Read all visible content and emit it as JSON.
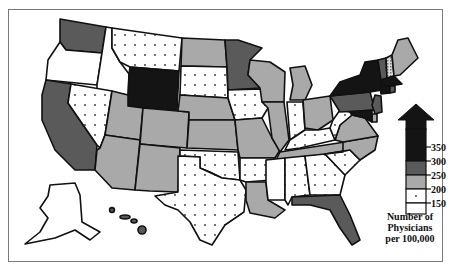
{
  "map": {
    "title": "Number of Physicians per 100,000",
    "legend": {
      "title_lines": [
        "Number of",
        "Physicians",
        "per 100,000"
      ],
      "ticks": [
        "350",
        "300",
        "250",
        "200",
        "150"
      ],
      "classes": [
        {
          "key": "over300",
          "label": "> 300",
          "fill": "#141414",
          "pattern": "solid"
        },
        {
          "key": "250_300",
          "label": "250–300",
          "fill": "#5a5a5a",
          "pattern": "solid"
        },
        {
          "key": "200_250",
          "label": "200–250",
          "fill": "#a9a9a9",
          "pattern": "solid"
        },
        {
          "key": "150_200",
          "label": "150–200",
          "fill": "#ffffff",
          "pattern": "dots"
        },
        {
          "key": "under150",
          "label": "< 150",
          "fill": "#ffffff",
          "pattern": "none"
        }
      ]
    },
    "states": {
      "WA": "250_300",
      "OR": "under150",
      "CA": "250_300",
      "ID": "under150",
      "NV": "150_200",
      "MT": "150_200",
      "WY": "over300",
      "UT": "200_250",
      "AZ": "200_250",
      "CO": "200_250",
      "NM": "200_250",
      "ND": "200_250",
      "SD": "150_200",
      "NE": "200_250",
      "KS": "200_250",
      "OK": "150_200",
      "TX": "150_200",
      "MN": "250_300",
      "IA": "150_200",
      "MO": "200_250",
      "AR": "150_200",
      "LA": "200_250",
      "WI": "200_250",
      "IL": "200_250",
      "MI": "200_250",
      "IN": "150_200",
      "OH": "200_250",
      "KY": "150_200",
      "TN": "200_250",
      "MS": "under150",
      "AL": "150_200",
      "GA": "150_200",
      "FL": "250_300",
      "SC": "150_200",
      "NC": "200_250",
      "VA": "200_250",
      "WV": "150_200",
      "PA": "250_300",
      "NY": "over300",
      "VT": "250_300",
      "NH": "hatched",
      "ME": "200_250",
      "MA": "over300",
      "CT": "over300",
      "RI": "250_300",
      "NJ": "250_300",
      "DE": "200_250",
      "MD": "over300",
      "AK": "under150",
      "HI": "250_300"
    }
  }
}
